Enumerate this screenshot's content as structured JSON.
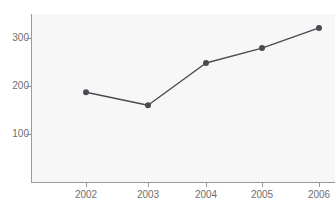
{
  "chart_data": {
    "type": "line",
    "title": "",
    "xlabel": "",
    "ylabel": "",
    "categories": [
      "2002",
      "2003",
      "2004",
      "2005",
      "2006"
    ],
    "values": [
      187,
      160,
      248,
      279,
      321
    ],
    "series": [
      {
        "name": "series-1",
        "values": [
          187,
          160,
          248,
          279,
          321
        ],
        "color": "#4a4a52",
        "marker": "circle"
      }
    ],
    "ylim": [
      0,
      355
    ],
    "y_ticks": [
      100,
      200,
      300
    ],
    "y_tick_labels": [
      "100",
      "200",
      "300"
    ],
    "x_tick_labels": [
      "2002",
      "2003",
      "2004",
      "2005",
      "2006"
    ],
    "grid": false,
    "legend": false,
    "legend_position": "none",
    "background_color": "#f7f7f8",
    "axis_color": "#9a9a9a",
    "tick_label_color": "#6f6f6f"
  },
  "axes": {
    "y_tick_0_label": "100",
    "y_tick_1_label": "200",
    "y_tick_2_label": "300",
    "x_tick_0_label": "2002",
    "x_tick_1_label": "2003",
    "x_tick_2_label": "2004",
    "x_tick_3_label": "2005",
    "x_tick_4_label": "2006"
  },
  "header": {
    "title": ""
  }
}
